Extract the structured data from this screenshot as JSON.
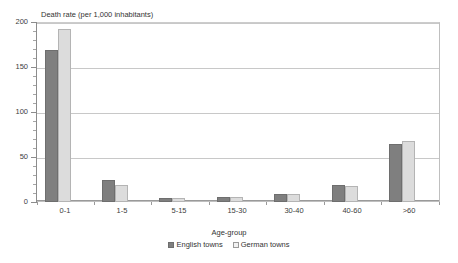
{
  "chart_data": {
    "type": "bar",
    "title": "",
    "ylabel": "Death rate (per 1,000 inhabitants)",
    "xlabel": "Age-group",
    "categories": [
      "0-1",
      "1-5",
      "5-15",
      "15-30",
      "30-40",
      "40-60",
      ">60"
    ],
    "series": [
      {
        "name": "English towns",
        "color": "#7f7f7f",
        "values": [
          170,
          25,
          4,
          6,
          9,
          19,
          65
        ]
      },
      {
        "name": "German towns",
        "color": "#dcdcdc",
        "values": [
          193,
          19,
          4,
          6,
          9,
          18,
          68
        ]
      }
    ],
    "ylim": [
      0,
      200
    ],
    "yticks": [
      0,
      50,
      100,
      150,
      200
    ],
    "ytick_labels": [
      "0",
      "50",
      "100",
      "150",
      "200"
    ],
    "grid": true,
    "legend_position": "bottom"
  },
  "legend": {
    "items": [
      {
        "label": "English towns"
      },
      {
        "label": "German towns"
      }
    ]
  },
  "caption": {
    "text": ""
  }
}
